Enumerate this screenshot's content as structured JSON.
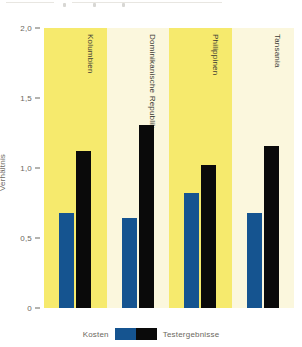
{
  "chart_data": {
    "type": "bar",
    "title": "",
    "subtitle": "",
    "xlabel": "",
    "ylabel": "Verhältnis",
    "ylim": [
      0,
      2.0
    ],
    "yticks": [
      0,
      0.5,
      1.0,
      1.5,
      2.0
    ],
    "ytick_labels": [
      "0",
      "0,5",
      "1,0",
      "1,5",
      "2,0"
    ],
    "grid": false,
    "legend_position": "bottom",
    "categories": [
      "Kolumbien",
      "Dominikanische Republik",
      "Philippinen",
      "Tansania"
    ],
    "series": [
      {
        "name": "Kosten",
        "color": "#155490",
        "values": [
          0.68,
          0.64,
          0.82,
          0.68
        ]
      },
      {
        "name": "Testergebnisse",
        "color": "#0a0a0a",
        "values": [
          1.12,
          1.31,
          1.02,
          1.16
        ]
      }
    ],
    "band_colors": [
      "#f6ea6d",
      "#fbf7dd"
    ],
    "background_color": "#ffffff"
  },
  "legend": {
    "left_label": "Kosten",
    "right_label": "Testergebnisse"
  },
  "axis": {
    "y_title": "Verhältnis"
  }
}
